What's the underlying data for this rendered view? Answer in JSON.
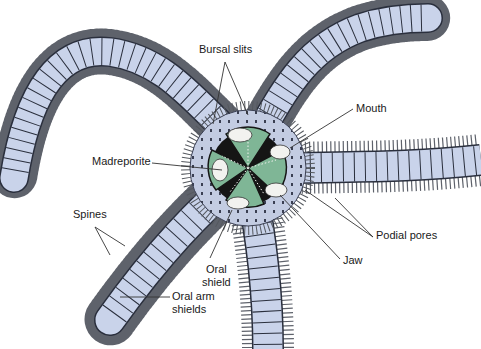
{
  "diagram": {
    "colors": {
      "arm_fill": "#c9d3ea",
      "arm_outline": "#2a2f3d",
      "spine": "#6b6e75",
      "disc_fill": "#b9c3dc",
      "oral_shield": "#7fb696",
      "jaw_white": "#f2f2ef",
      "center_dark": "#151515",
      "leader_line": "#333333"
    },
    "labels": {
      "bursal_slits": "Bursal slits",
      "mouth": "Mouth",
      "madreporite": "Madreporite",
      "spines": "Spines",
      "oral_arm_shields_1": "Oral arm",
      "oral_arm_shields_2": "shields",
      "oral_shield_1": "Oral",
      "oral_shield_2": "shield",
      "jaw": "Jaw",
      "podial_pores": "Podial pores"
    }
  }
}
